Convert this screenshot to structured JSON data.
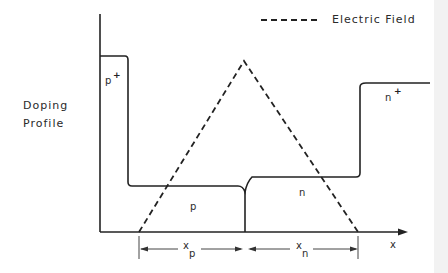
{
  "legend": {
    "line_style": "dashed",
    "label": "Electric Field"
  },
  "axes": {
    "y_label_line1": "Doping",
    "y_label_line2": "Profile",
    "x_label": "x"
  },
  "regions": {
    "p_plus": {
      "label": "p",
      "superscript": "+"
    },
    "p": {
      "label": "p"
    },
    "n": {
      "label": "n"
    },
    "n_plus": {
      "label": "n",
      "superscript": "+"
    }
  },
  "dimensions": {
    "xp": {
      "base": "x",
      "subscript": "p"
    },
    "xn": {
      "base": "x",
      "subscript": "n"
    }
  },
  "colors": {
    "line": "#222222",
    "background": "#ffffff"
  }
}
